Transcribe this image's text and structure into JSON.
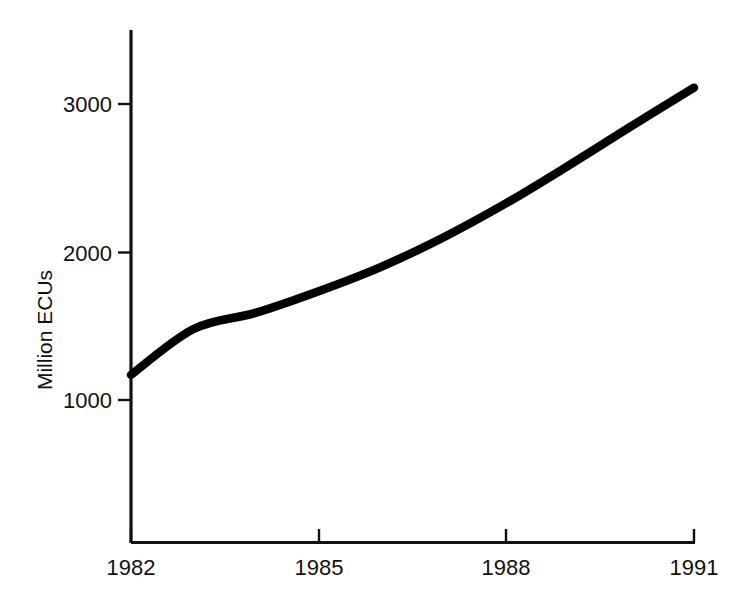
{
  "chart_data": {
    "type": "line",
    "title": "",
    "subtitle": "",
    "xlabel": "",
    "ylabel": "Million ECUs",
    "x": [
      1982,
      1983,
      1984,
      1985,
      1986,
      1987,
      1988,
      1989,
      1990,
      1991
    ],
    "values": [
      1170,
      1480,
      1590,
      1735,
      1900,
      2100,
      2330,
      2585,
      2850,
      3110
    ],
    "series": [
      {
        "name": "Million ECUs",
        "values": [
          1170,
          1480,
          1590,
          1735,
          1900,
          2100,
          2330,
          2585,
          2850,
          3110
        ]
      }
    ],
    "xlim": [
      1982,
      1991
    ],
    "ylim": [
      600,
      3460
    ],
    "xticks": [
      1982,
      1985,
      1988,
      1991
    ],
    "xtick_labels": [
      "1982",
      "1985",
      "1988",
      "1991"
    ],
    "yticks": [
      1000,
      2000,
      3000
    ],
    "ytick_labels": [
      "1000",
      "2000",
      "3000"
    ],
    "grid": false,
    "legend": false,
    "legend_position": "none",
    "line_color": "#000000",
    "background_color": "#ffffff",
    "axis_color": "#111111",
    "annotations": []
  },
  "axes": {
    "y_axis_title": "Million ECUs",
    "y_tick_labels": [
      "3000",
      "2000",
      "1000"
    ],
    "x_tick_labels": [
      "1982",
      "1985",
      "1988",
      "1991"
    ]
  }
}
